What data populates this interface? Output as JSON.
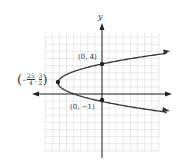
{
  "chart_data": {
    "type": "line",
    "title": "",
    "xlabel": "",
    "ylabel": "y",
    "xlim": [
      -9,
      9
    ],
    "ylim": [
      -8,
      9
    ],
    "grid": true,
    "series": [
      {
        "name": "parabola opening right, vertex (-25/4, 3/2)",
        "points": [
          {
            "x": 9,
            "y": 5.4
          },
          {
            "x": 0,
            "y": 4
          },
          {
            "x": -6.25,
            "y": 1.5
          },
          {
            "x": 0,
            "y": -1
          },
          {
            "x": 9,
            "y": -2.4
          }
        ]
      }
    ],
    "annotations": [
      {
        "label": "(0, 4)",
        "x": 0,
        "y": 4
      },
      {
        "label": "(0, −1)",
        "x": 0,
        "y": -1
      },
      {
        "label": "(−25/4, 3/2)",
        "x": -6.25,
        "y": 1.5
      }
    ]
  },
  "labels": {
    "y_axis": "y",
    "point_top": "(0, 4)",
    "point_bottom": "(0, −1)",
    "vertex_num": "25",
    "vertex_den": "4",
    "vertex_y_num": "3",
    "vertex_y_den": "2"
  }
}
